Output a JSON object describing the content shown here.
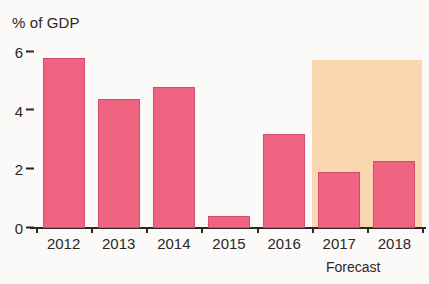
{
  "chart_data": {
    "type": "bar",
    "title": "% of GDP",
    "xlabel": "",
    "ylabel": "% of GDP",
    "categories": [
      "2012",
      "2013",
      "2014",
      "2015",
      "2016",
      "2017",
      "2018"
    ],
    "values": [
      5.8,
      4.4,
      4.8,
      0.4,
      3.2,
      1.9,
      2.3
    ],
    "series": [
      {
        "name": "% of GDP",
        "values": [
          5.8,
          4.4,
          4.8,
          0.4,
          3.2,
          1.9,
          2.3
        ]
      }
    ],
    "ylim": [
      0,
      6.2
    ],
    "yticks": [
      0,
      2,
      4,
      6
    ],
    "ytick_labels": [
      "0",
      "2",
      "4",
      "6"
    ],
    "grid": false,
    "legend": "none",
    "annotations": [
      {
        "text": "Forecast",
        "applies_to": [
          "2017",
          "2018"
        ],
        "style": "shaded-band"
      }
    ],
    "bar_color": "#ef6481",
    "bar_border_color": "#cf4f6a",
    "forecast_band_color": "#f9d5b0",
    "axis_color": "#2b2726",
    "background_color": "#fbfaf8"
  },
  "labels": {
    "axis_title": "% of GDP",
    "forecast_caption": "Forecast"
  }
}
